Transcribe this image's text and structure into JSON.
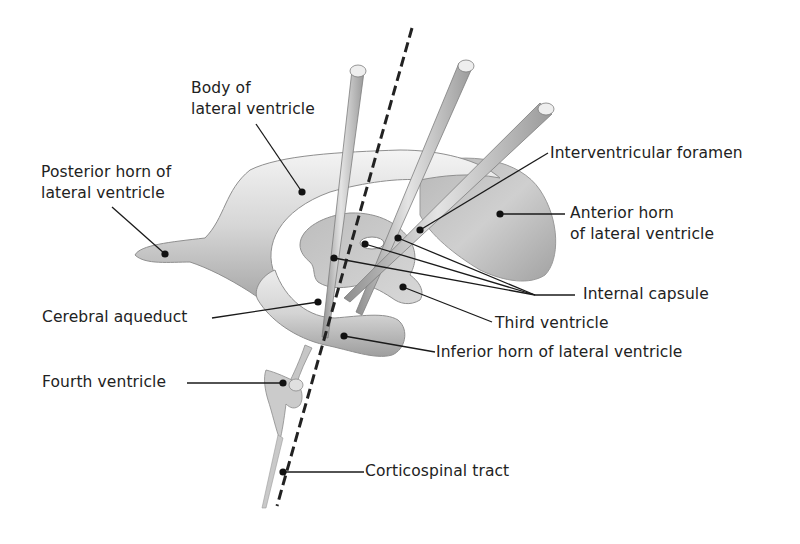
{
  "figure": {
    "colors": {
      "background": "#ffffff",
      "structure_fill": "#d9d9d9",
      "structure_shade": "#a8a8a8",
      "rod_fill": "#c8c8c8",
      "rod_cap": "#eeeeee",
      "line": "#1a1a1a",
      "text": "#222222"
    }
  },
  "labels": {
    "body_of_lateral_ventricle": {
      "line1": "Body of",
      "line2": "lateral ventricle"
    },
    "posterior_horn": {
      "line1": "Posterior horn of",
      "line2": "lateral ventricle"
    },
    "interventricular_foramen": {
      "line1": "Interventricular foramen"
    },
    "anterior_horn": {
      "line1": "Anterior horn",
      "line2": "of lateral ventricle"
    },
    "internal_capsule": {
      "line1": "Internal capsule"
    },
    "cerebral_aqueduct": {
      "line1": "Cerebral aqueduct"
    },
    "third_ventricle": {
      "line1": "Third ventricle"
    },
    "inferior_horn": {
      "line1": "Inferior horn of lateral ventricle"
    },
    "fourth_ventricle": {
      "line1": "Fourth ventricle"
    },
    "corticospinal_tract": {
      "line1": "Corticospinal tract"
    }
  }
}
